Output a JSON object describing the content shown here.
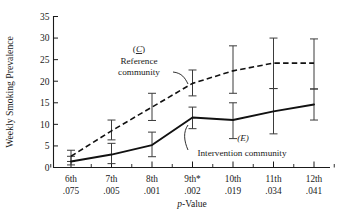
{
  "chart_data": {
    "type": "line",
    "title": "",
    "xlabel": "p-Value",
    "ylabel": "Weekly Smoking Prevalence",
    "categories": [
      "6th",
      "7th",
      "8th",
      "9th*",
      "10th",
      "11th",
      "12th"
    ],
    "category_sublabels": [
      ".075",
      ".005",
      ".001",
      ".002",
      ".019",
      ".034",
      ".041"
    ],
    "ylim": [
      0,
      35
    ],
    "yticks": [
      0,
      5,
      10,
      15,
      20,
      25,
      30,
      35
    ],
    "grid": false,
    "legend_position": "inline-annotations",
    "series": [
      {
        "name": "Reference community",
        "key": "C",
        "style": "dashed",
        "values": [
          2.6,
          8.5,
          14.0,
          19.5,
          22.4,
          24.2,
          24.2
        ],
        "error_low": [
          1.4,
          6.4,
          10.9,
          16.6,
          17.2,
          18.3,
          18.2
        ],
        "error_high": [
          4.0,
          11.0,
          17.2,
          22.6,
          28.2,
          30.0,
          29.8
        ]
      },
      {
        "name": "Intervention community",
        "key": "E",
        "style": "solid",
        "values": [
          1.4,
          3.0,
          5.2,
          11.6,
          11.0,
          13.0,
          14.6
        ],
        "error_low": [
          0.6,
          0.9,
          2.5,
          9.0,
          6.7,
          7.8,
          11.0
        ],
        "error_high": [
          2.6,
          5.6,
          8.2,
          14.0,
          15.0,
          18.3,
          18.2
        ]
      }
    ],
    "annotations": [
      {
        "id": "ref",
        "key": "(C)",
        "key_letter": "C",
        "line1": "Reference",
        "line2": "community"
      },
      {
        "id": "int",
        "key": "(E)",
        "key_letter": "E",
        "label": "Intervention community"
      }
    ]
  }
}
